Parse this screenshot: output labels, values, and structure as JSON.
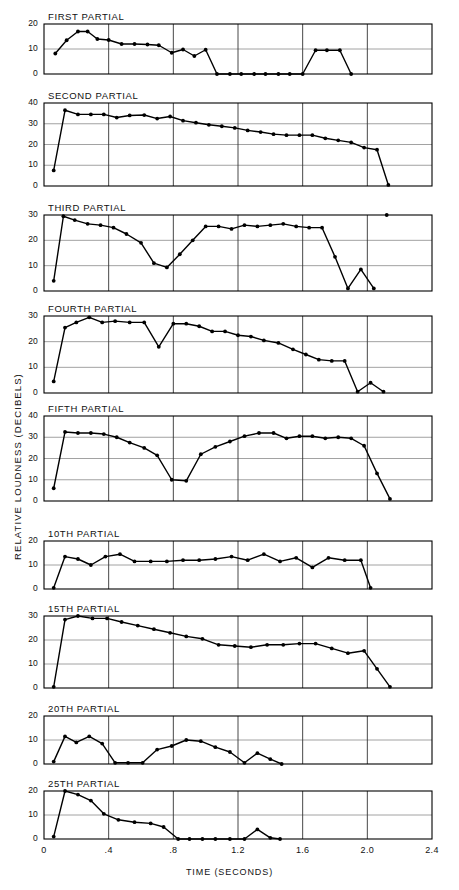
{
  "figure": {
    "xlabel": "TIME (SECONDS)",
    "ylabel": "RELATIVE LOUDNESS  (DECIBELS)",
    "xticks": [
      "0",
      ".4",
      ".8",
      "1.2",
      "1.6",
      "2.0",
      "2.4"
    ],
    "xlim": [
      0,
      2.4
    ],
    "grid": "vertical every 0.4 s, horizontal every 10 dB",
    "line_color": "#000000",
    "grid_color": "#8a8a8a",
    "axis_color": "#000000"
  },
  "chart_data": {
    "type": "line",
    "title": "",
    "xlabel": "TIME (SECONDS)",
    "ylabel": "RELATIVE LOUDNESS  (DECIBELS)",
    "xlim": [
      0,
      2.4
    ],
    "xticks": [
      0,
      0.4,
      0.8,
      1.2,
      1.6,
      2.0,
      2.4
    ],
    "grid": true,
    "legend": "none",
    "panels": [
      {
        "label": "FIRST PARTIAL",
        "ylim": [
          0,
          20
        ],
        "yticks": [
          0,
          10,
          20
        ],
        "x": [
          0.07,
          0.14,
          0.21,
          0.27,
          0.33,
          0.4,
          0.48,
          0.56,
          0.64,
          0.71,
          0.79,
          0.86,
          0.93,
          1.0,
          1.07,
          1.15,
          1.22,
          1.3,
          1.37,
          1.45,
          1.52,
          1.6,
          1.68,
          1.75,
          1.83,
          1.9
        ],
        "y": [
          8.2,
          13.5,
          17.0,
          17.0,
          14.0,
          13.6,
          12.0,
          12.0,
          11.8,
          11.5,
          8.5,
          9.8,
          7.2,
          9.7,
          0.0,
          0.0,
          0.0,
          0.0,
          0.0,
          0.0,
          0.0,
          0.0,
          9.5,
          9.5,
          9.5,
          0.0
        ]
      },
      {
        "label": "SECOND PARTIAL",
        "ylim": [
          0,
          40
        ],
        "yticks": [
          0,
          10,
          20,
          30,
          40
        ],
        "x": [
          0.06,
          0.13,
          0.21,
          0.29,
          0.37,
          0.45,
          0.53,
          0.62,
          0.7,
          0.78,
          0.86,
          0.94,
          1.02,
          1.1,
          1.18,
          1.26,
          1.34,
          1.42,
          1.5,
          1.58,
          1.66,
          1.74,
          1.82,
          1.9,
          1.98,
          2.06,
          2.13
        ],
        "y": [
          7.5,
          36.5,
          34.5,
          34.5,
          34.5,
          33.0,
          34.0,
          34.2,
          32.5,
          33.5,
          31.5,
          30.5,
          29.5,
          28.8,
          28.0,
          26.8,
          26.0,
          25.0,
          24.5,
          24.5,
          24.5,
          23.0,
          22.0,
          21.0,
          18.5,
          17.5,
          0.5
        ]
      },
      {
        "label": "THIRD PARTIAL",
        "ylim": [
          0,
          30
        ],
        "yticks": [
          0,
          10,
          20,
          30
        ],
        "x": [
          0.06,
          0.12,
          0.19,
          0.27,
          0.35,
          0.43,
          0.51,
          0.6,
          0.68,
          0.76,
          0.84,
          0.92,
          1.0,
          1.08,
          1.16,
          1.24,
          1.32,
          1.4,
          1.48,
          1.56,
          1.64,
          1.72,
          1.8,
          1.88,
          1.96,
          2.04,
          2.12
        ],
        "y": [
          4.0,
          29.5,
          28.0,
          26.5,
          26.0,
          25.0,
          22.5,
          19.0,
          11.0,
          9.3,
          14.5,
          20.0,
          25.5,
          25.5,
          24.5,
          26.0,
          25.5,
          26.0,
          26.5,
          25.5,
          25.0,
          25.0,
          13.5,
          1.0,
          8.5,
          1.0
        ]
      },
      {
        "label": "FOURTH PARTIAL",
        "ylim": [
          0,
          30
        ],
        "yticks": [
          0,
          10,
          20,
          30
        ],
        "x": [
          0.06,
          0.13,
          0.2,
          0.28,
          0.36,
          0.44,
          0.53,
          0.62,
          0.71,
          0.8,
          0.88,
          0.96,
          1.04,
          1.12,
          1.2,
          1.28,
          1.36,
          1.45,
          1.54,
          1.62,
          1.7,
          1.78,
          1.86,
          1.94,
          2.02,
          2.1
        ],
        "y": [
          4.5,
          25.5,
          27.5,
          29.5,
          27.5,
          28.0,
          27.5,
          27.5,
          18.0,
          27.0,
          27.0,
          26.0,
          24.0,
          24.0,
          22.5,
          22.0,
          20.5,
          19.5,
          17.0,
          15.0,
          13.0,
          12.5,
          12.5,
          0.5,
          4.0,
          0.5
        ]
      },
      {
        "label": "FIFTH PARTIAL",
        "ylim": [
          0,
          40
        ],
        "yticks": [
          0,
          10,
          20,
          30,
          40
        ],
        "x": [
          0.06,
          0.13,
          0.21,
          0.29,
          0.37,
          0.45,
          0.53,
          0.62,
          0.7,
          0.79,
          0.88,
          0.97,
          1.06,
          1.15,
          1.24,
          1.33,
          1.42,
          1.5,
          1.58,
          1.66,
          1.74,
          1.82,
          1.9,
          1.98,
          2.06,
          2.14
        ],
        "y": [
          6.0,
          32.5,
          32.0,
          32.0,
          31.5,
          30.0,
          27.5,
          25.0,
          21.5,
          10.0,
          9.5,
          22.0,
          25.5,
          28.0,
          30.5,
          32.0,
          32.0,
          29.5,
          30.5,
          30.5,
          29.5,
          30.0,
          29.5,
          26.0,
          13.0,
          1.0
        ]
      },
      {
        "label": "10TH PARTIAL",
        "ylim": [
          0,
          20
        ],
        "yticks": [
          0,
          10,
          20
        ],
        "x": [
          0.06,
          0.13,
          0.21,
          0.29,
          0.38,
          0.47,
          0.56,
          0.66,
          0.76,
          0.86,
          0.96,
          1.06,
          1.16,
          1.26,
          1.36,
          1.46,
          1.56,
          1.66,
          1.76,
          1.86,
          1.96,
          2.02
        ],
        "y": [
          0.5,
          13.5,
          12.5,
          10.0,
          13.5,
          14.5,
          11.5,
          11.5,
          11.5,
          12.0,
          12.0,
          12.5,
          13.5,
          12.0,
          14.5,
          11.5,
          13.0,
          9.0,
          13.0,
          12.0,
          12.0,
          0.5
        ]
      },
      {
        "label": "15TH PARTIAL",
        "ylim": [
          0,
          30
        ],
        "yticks": [
          0,
          10,
          20,
          30
        ],
        "x": [
          0.06,
          0.13,
          0.21,
          0.3,
          0.39,
          0.48,
          0.58,
          0.68,
          0.78,
          0.88,
          0.98,
          1.08,
          1.18,
          1.28,
          1.38,
          1.48,
          1.58,
          1.68,
          1.78,
          1.88,
          1.98,
          2.06,
          2.14
        ],
        "y": [
          0.5,
          28.5,
          30.0,
          29.0,
          29.0,
          27.5,
          26.0,
          24.5,
          23.0,
          21.5,
          20.5,
          18.0,
          17.5,
          17.0,
          18.0,
          18.0,
          18.5,
          18.5,
          16.5,
          14.5,
          15.5,
          8.0,
          0.5
        ]
      },
      {
        "label": "20TH PARTIAL",
        "ylim": [
          0,
          20
        ],
        "yticks": [
          0,
          10,
          20
        ],
        "x": [
          0.06,
          0.13,
          0.2,
          0.28,
          0.36,
          0.44,
          0.52,
          0.61,
          0.7,
          0.79,
          0.88,
          0.97,
          1.06,
          1.15,
          1.24,
          1.32,
          1.4,
          1.47
        ],
        "y": [
          1.0,
          11.5,
          9.0,
          11.5,
          8.5,
          0.5,
          0.5,
          0.5,
          6.0,
          7.5,
          10.0,
          9.5,
          7.0,
          5.0,
          0.5,
          4.5,
          2.0,
          0.0
        ]
      },
      {
        "label": "25TH PARTIAL",
        "ylim": [
          0,
          20
        ],
        "yticks": [
          0,
          10,
          20
        ],
        "x": [
          0.06,
          0.13,
          0.21,
          0.29,
          0.37,
          0.46,
          0.56,
          0.66,
          0.74,
          0.83,
          0.9,
          0.98,
          1.06,
          1.15,
          1.24,
          1.32,
          1.4,
          1.46
        ],
        "y": [
          1.0,
          20.0,
          18.5,
          16.0,
          10.5,
          8.0,
          7.0,
          6.5,
          5.0,
          0.0,
          0.0,
          0.0,
          0.0,
          0.0,
          0.0,
          4.0,
          0.5,
          0.0
        ]
      }
    ]
  }
}
